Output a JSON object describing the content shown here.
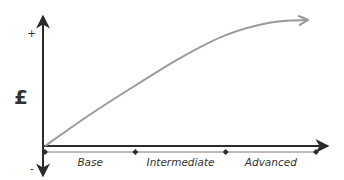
{
  "chart_data": {
    "type": "line",
    "title": "",
    "ylabel": "£",
    "y_positive_label": "+",
    "y_negative_label": "-",
    "xlabel": "",
    "categories": [
      "Base",
      "Intermediate",
      "Advanced"
    ],
    "category_boundaries": [
      0,
      1,
      2,
      3
    ],
    "series": [
      {
        "name": "value",
        "description": "Rising curve that levels off near the end",
        "x": [
          0,
          0.5,
          1.0,
          1.5,
          2.0,
          2.5,
          2.9
        ],
        "y": [
          0,
          0.25,
          0.48,
          0.7,
          0.88,
          0.98,
          1.0
        ]
      }
    ],
    "xlim": [
      0,
      3.1
    ],
    "ylim": [
      -0.25,
      1.1
    ],
    "grid": false,
    "legend": "none",
    "colors": {
      "axis": "#2b2b2b",
      "curve": "#9a9a9a",
      "text": "#333333"
    }
  }
}
